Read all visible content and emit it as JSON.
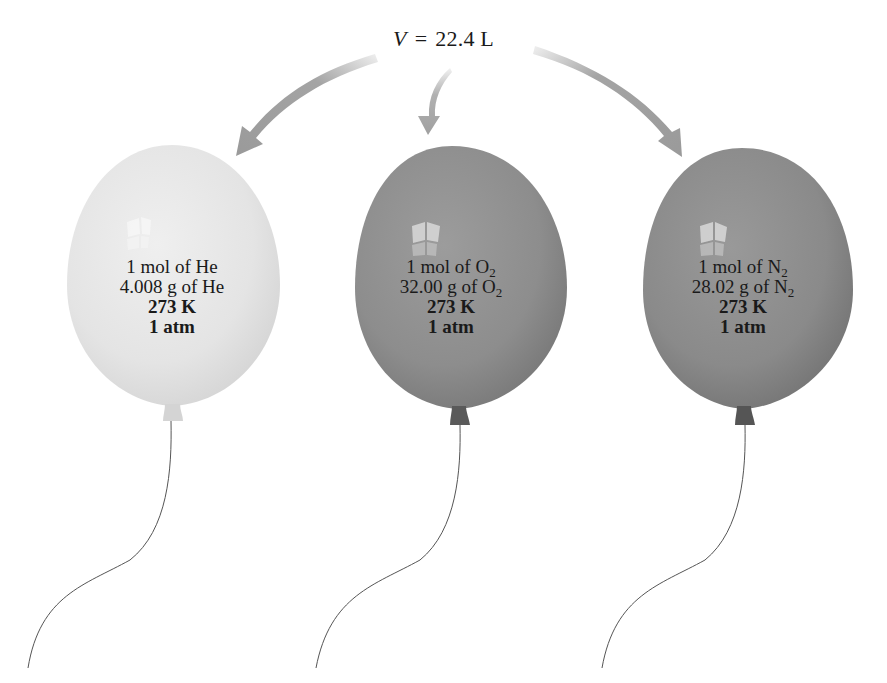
{
  "figure": {
    "volume": {
      "symbol": "V",
      "equals": "=",
      "value": "22.4 L"
    },
    "arrows": [
      {
        "target": "He balloon",
        "icon": "curved-arrow-left"
      },
      {
        "target": "O2 balloon",
        "icon": "curved-arrow-down"
      },
      {
        "target": "N2 balloon",
        "icon": "curved-arrow-right"
      }
    ],
    "balloons": [
      {
        "gas": "He",
        "color": "#e6e6e6",
        "knot_color": "#d0d0d0",
        "moles_prefix": "1 mol of ",
        "moles_formula": "He",
        "moles_subscript": "",
        "mass_prefix": "4.008 g of ",
        "mass_formula": "He",
        "mass_subscript": "",
        "temperature": "273 K",
        "pressure": "1 atm"
      },
      {
        "gas": "O2",
        "color": "#8f8f8f",
        "knot_color": "#5a5a5a",
        "moles_prefix": "1 mol of ",
        "moles_formula": "O",
        "moles_subscript": "2",
        "mass_prefix": "32.00 g of ",
        "mass_formula": "O",
        "mass_subscript": "2",
        "temperature": "273 K",
        "pressure": "1 atm"
      },
      {
        "gas": "N2",
        "color": "#8a8a8a",
        "knot_color": "#555555",
        "moles_prefix": "1 mol of ",
        "moles_formula": "N",
        "moles_subscript": "2",
        "mass_prefix": "28.02 g of ",
        "mass_formula": "N",
        "mass_subscript": "2",
        "temperature": "273 K",
        "pressure": "1 atm"
      }
    ],
    "colors": {
      "arrow": "#9a9a9a",
      "string": "#555555",
      "text": "#1a1a1a",
      "background": "#ffffff"
    }
  }
}
